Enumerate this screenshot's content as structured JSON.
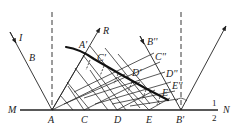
{
  "diagram": {
    "colors": {
      "line": "#222222",
      "background": "#ffffff"
    },
    "labels": {
      "M": "M",
      "N": "N",
      "A": "A",
      "C": "C",
      "D": "D",
      "E": "E",
      "Bp": "B'",
      "I": "I",
      "B": "B",
      "R": "R",
      "Ap": "A'",
      "Cp": "C'",
      "Dp": "D'",
      "Ep": "E'",
      "Bpp": "B''",
      "Cpp": "C''",
      "Dpp": "D''",
      "Epp": "E''",
      "one": "1",
      "two": "2"
    }
  }
}
